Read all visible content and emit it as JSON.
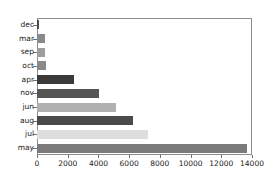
{
  "chart_data": {
    "type": "bar",
    "orientation": "horizontal",
    "title": "",
    "xlabel": "",
    "ylabel": "",
    "xlim": [
      0,
      14000
    ],
    "ylim": null,
    "grid": false,
    "legend": null,
    "xticks": [
      0,
      2000,
      4000,
      6000,
      8000,
      10000,
      12000,
      14000
    ],
    "xtick_labels": [
      "0",
      "2000",
      "4000",
      "6000",
      "8000",
      "10000",
      "12000",
      "14000"
    ],
    "categories": [
      "dec",
      "mar",
      "sep",
      "oct",
      "apr",
      "nov",
      "jun",
      "aug",
      "jul",
      "may"
    ],
    "values": [
      130,
      540,
      520,
      610,
      2400,
      4050,
      5150,
      6250,
      7250,
      13700
    ],
    "bar_colors": [
      "#4d4d4d",
      "#8a8a8a",
      "#9e9e9e",
      "#8a8a8a",
      "#3a3a3a",
      "#555555",
      "#b0b0b0",
      "#4a4a4a",
      "#dedede",
      "#7a7a7a"
    ]
  },
  "axes": {
    "frame_color": "#8c8c8c",
    "tick_color": "#6f6f6f",
    "text_color": "#1a1a1a"
  }
}
